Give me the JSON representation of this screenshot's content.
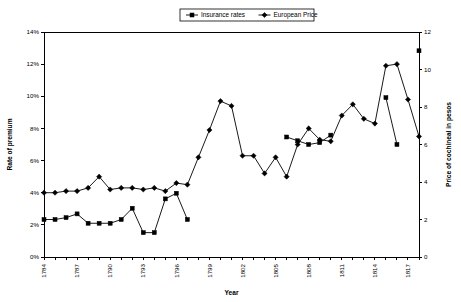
{
  "chart_data": {
    "type": "line",
    "title": "",
    "xlabel": "Year",
    "ylabel": "Rate of premium",
    "y2label": "Price of cochineal in pesos",
    "grid": false,
    "legend_position": "top-center",
    "xlim": [
      1784,
      1818
    ],
    "ylim": [
      0,
      14
    ],
    "y2lim": [
      0,
      12
    ],
    "ytick_labels": [
      "0%",
      "2%",
      "4%",
      "6%",
      "8%",
      "10%",
      "12%",
      "14%"
    ],
    "ytick_values": [
      0,
      2,
      4,
      6,
      8,
      10,
      12,
      14
    ],
    "y2tick_labels": [
      "0",
      "2",
      "4",
      "6",
      "8",
      "10",
      "12"
    ],
    "y2tick_values": [
      0,
      2,
      4,
      6,
      8,
      10,
      12
    ],
    "xtick_labels": [
      "1784",
      "1787",
      "1790",
      "1793",
      "1796",
      "1799",
      "1802",
      "1805",
      "1808",
      "1811",
      "1814",
      "1817"
    ],
    "xtick_values": [
      1784,
      1787,
      1790,
      1793,
      1796,
      1799,
      1802,
      1805,
      1808,
      1811,
      1814,
      1817
    ],
    "x_minor_step": 1,
    "series": [
      {
        "name": "Insurance rates",
        "marker": "square",
        "axis": "right",
        "unit": "pesos",
        "points": [
          {
            "x": 1784,
            "y": 2.0
          },
          {
            "x": 1785,
            "y": 2.0
          },
          {
            "x": 1786,
            "y": 2.1
          },
          {
            "x": 1787,
            "y": 2.3
          },
          {
            "x": 1788,
            "y": 1.8
          },
          {
            "x": 1789,
            "y": 1.8
          },
          {
            "x": 1790,
            "y": 1.8
          },
          {
            "x": 1791,
            "y": 2.0
          },
          {
            "x": 1792,
            "y": 2.6
          },
          {
            "x": 1793,
            "y": 1.3
          },
          {
            "x": 1794,
            "y": 1.3
          },
          {
            "x": 1795,
            "y": 3.1
          },
          {
            "x": 1796,
            "y": 3.4
          },
          {
            "x": 1797,
            "y": 2.0
          },
          {
            "x": 1806,
            "y": 6.4
          },
          {
            "x": 1807,
            "y": 6.2
          },
          {
            "x": 1808,
            "y": 6.0
          },
          {
            "x": 1809,
            "y": 6.1
          },
          {
            "x": 1810,
            "y": 6.5
          },
          {
            "x": 1815,
            "y": 8.5
          },
          {
            "x": 1816,
            "y": 6.0
          },
          {
            "x": 1818,
            "y": 11.0
          }
        ]
      },
      {
        "name": "European Price",
        "marker": "diamond",
        "axis": "left",
        "unit": "percent",
        "points": [
          {
            "x": 1784,
            "y": 4.0
          },
          {
            "x": 1785,
            "y": 4.0
          },
          {
            "x": 1786,
            "y": 4.1
          },
          {
            "x": 1787,
            "y": 4.1
          },
          {
            "x": 1788,
            "y": 4.3
          },
          {
            "x": 1789,
            "y": 5.0
          },
          {
            "x": 1790,
            "y": 4.2
          },
          {
            "x": 1791,
            "y": 4.3
          },
          {
            "x": 1792,
            "y": 4.3
          },
          {
            "x": 1793,
            "y": 4.2
          },
          {
            "x": 1794,
            "y": 4.3
          },
          {
            "x": 1795,
            "y": 4.1
          },
          {
            "x": 1796,
            "y": 4.6
          },
          {
            "x": 1797,
            "y": 4.5
          },
          {
            "x": 1798,
            "y": 6.2
          },
          {
            "x": 1799,
            "y": 7.9
          },
          {
            "x": 1800,
            "y": 9.7
          },
          {
            "x": 1801,
            "y": 9.4
          },
          {
            "x": 1802,
            "y": 6.3
          },
          {
            "x": 1803,
            "y": 6.3
          },
          {
            "x": 1804,
            "y": 5.2
          },
          {
            "x": 1805,
            "y": 6.2
          },
          {
            "x": 1806,
            "y": 5.0
          },
          {
            "x": 1807,
            "y": 7.0
          },
          {
            "x": 1808,
            "y": 8.0
          },
          {
            "x": 1809,
            "y": 7.3
          },
          {
            "x": 1810,
            "y": 7.2
          },
          {
            "x": 1811,
            "y": 8.8
          },
          {
            "x": 1812,
            "y": 9.5
          },
          {
            "x": 1813,
            "y": 8.6
          },
          {
            "x": 1814,
            "y": 8.3
          },
          {
            "x": 1815,
            "y": 11.9
          },
          {
            "x": 1816,
            "y": 12.0
          },
          {
            "x": 1817,
            "y": 9.8
          },
          {
            "x": 1818,
            "y": 7.5
          }
        ]
      }
    ]
  }
}
